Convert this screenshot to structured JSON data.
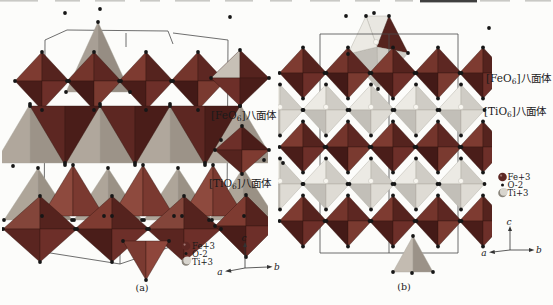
{
  "figure": {
    "panels": {
      "a": {
        "caption": "(a)"
      },
      "b": {
        "caption": "(b)"
      }
    },
    "labels": {
      "feo6_mid": {
        "pre": "[FeO",
        "sub": "6",
        "suf": "]八面体"
      },
      "tio6_mid": {
        "pre": "[TiO",
        "sub": "6",
        "suf": "]八面体"
      },
      "feo6_right": {
        "pre": "[FeO",
        "sub": "6",
        "suf": "]八面体"
      },
      "tio6_right": {
        "pre": "[TiO",
        "sub": "6",
        "suf": "]八面体"
      }
    },
    "legend": {
      "fe": "Fe+3",
      "o": "O-2",
      "ti": "Ti+3"
    },
    "axes": {
      "c": "c",
      "a": "a",
      "b": "b"
    },
    "colors": {
      "background": "#fcfcfa",
      "cell_line": "#4a4a4a",
      "axis_line": "#333333",
      "vertex_dot": "#161616",
      "fe_face_tl": "#7e3b31",
      "fe_face_tr": "#55231e",
      "fe_face_bl": "#4a1d19",
      "fe_face_br": "#6d2f29",
      "fe_face_tl_alt": "#74352c",
      "fe_face_tr_alt": "#5d2722",
      "fe_face_bl_alt": "#431a17",
      "fe_face_br_alt": "#7a3a30",
      "fe_big_tl": "#83453a",
      "ti_face_tl": "#eceae4",
      "ti_face_tr": "#cfccc5",
      "ti_face_bl": "#c2bfb8",
      "ti_face_br": "#dedbd4",
      "ti_center_dot": "#f8f6f0",
      "gray_tri_l": "#b0a79c",
      "gray_tri_r": "#9c9388",
      "red_tri_l": "#8e4a3e",
      "red_tri_r": "#7a3930",
      "dark_tri_l": "#5d2722",
      "dark_tri_r": "#4a1d19",
      "sample_fe_tl": "#c7c0b6",
      "fe_legend_sphere": "#5d2723",
      "ti_legend_sphere": "#d8d5ce",
      "ti_legend_shadow": "#8a857c",
      "crop_mark_light": "#c9c9c5",
      "crop_mark_dark": "#3f3f3f"
    }
  }
}
